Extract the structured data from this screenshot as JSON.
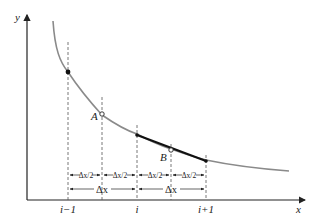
{
  "axes": {
    "x_label": "x",
    "y_label": "y"
  },
  "ticks": {
    "left": "i−1",
    "mid": "i",
    "right": "i+1"
  },
  "points": {
    "A": "A",
    "B": "B"
  },
  "dimensions": {
    "half": [
      "Δx/2",
      "Δx/2",
      "Δx/2",
      "Δx/2"
    ],
    "full": [
      "Δx",
      "Δx"
    ]
  },
  "colors": {
    "curve": "#8a8a8a",
    "axis": "#222222",
    "chord": "#111111",
    "guide": "#555555"
  }
}
